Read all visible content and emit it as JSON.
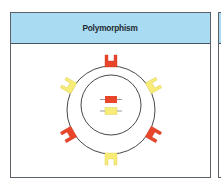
{
  "panel": {
    "title": "Polymorphism"
  },
  "colors": {
    "header_bg": "#a9dcf3",
    "red": "#e8452a",
    "yellow": "#f7ec78",
    "outline": "#333333"
  },
  "diagram": {
    "outer_circle": {
      "cx": 111,
      "cy": 110,
      "r": 44
    },
    "inner_circle": {
      "cx": 111,
      "cy": 105,
      "r": 30
    },
    "receptors": [
      {
        "angle": 0,
        "color": "red"
      },
      {
        "angle": 60,
        "color": "yellow"
      },
      {
        "angle": 120,
        "color": "red"
      },
      {
        "angle": 180,
        "color": "yellow"
      },
      {
        "angle": 240,
        "color": "red"
      },
      {
        "angle": 300,
        "color": "yellow"
      }
    ],
    "alleles": [
      {
        "color": "red"
      },
      {
        "color": "yellow"
      }
    ]
  }
}
